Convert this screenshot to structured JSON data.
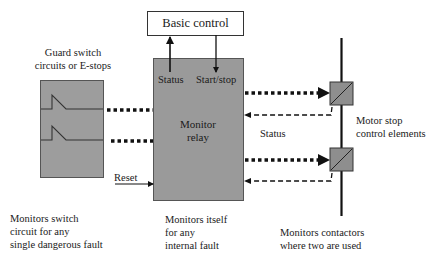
{
  "diagram": {
    "type": "block-diagram",
    "colors": {
      "block_fill": "#9a9a9a",
      "contactor_fill": "#8e8e8e",
      "line": "#111111",
      "background": "#ffffff"
    },
    "basic_control": {
      "label": "Basic control"
    },
    "monitor_relay": {
      "label_line1": "Monitor",
      "label_line2": "relay",
      "status_port": "Status",
      "start_stop_port": "Start/stop",
      "reset_input": "Reset"
    },
    "guard_switch": {
      "title_line1": "Guard switch",
      "title_line2": "circuits or E-stops",
      "caption_line1": "Monitors switch",
      "caption_line2": "circuit for any",
      "caption_line3": "single dangerous fault"
    },
    "relay_caption": {
      "line1": "Monitors itself",
      "line2": "for any",
      "line3": "internal fault"
    },
    "motor_stop": {
      "label_line1": "Motor stop",
      "label_line2": "control elements",
      "status_label": "Status",
      "caption_line1": "Monitors contactors",
      "caption_line2": "where two are used"
    }
  }
}
